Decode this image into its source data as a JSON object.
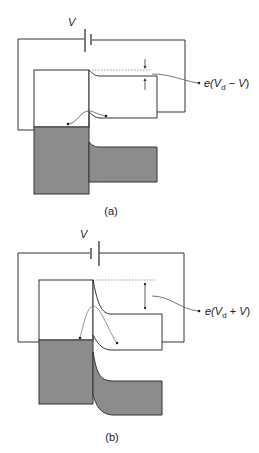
{
  "panels": [
    {
      "id": "a",
      "caption": "(a)",
      "battery_label": "V",
      "annotation": {
        "prefix": "e(",
        "var1": "V",
        "sub": "d",
        "op": " − ",
        "var2": "V",
        "suffix": ")"
      },
      "bias": "forward"
    },
    {
      "id": "b",
      "caption": "(b)",
      "battery_label": "V",
      "annotation": {
        "prefix": "e(",
        "var1": "V",
        "sub": "d",
        "op": " + ",
        "var2": "V",
        "suffix": ")"
      },
      "bias": "reverse"
    }
  ],
  "colors": {
    "fill_band": "#8c8c8c",
    "line": "#333333",
    "dotted": "#999999"
  }
}
